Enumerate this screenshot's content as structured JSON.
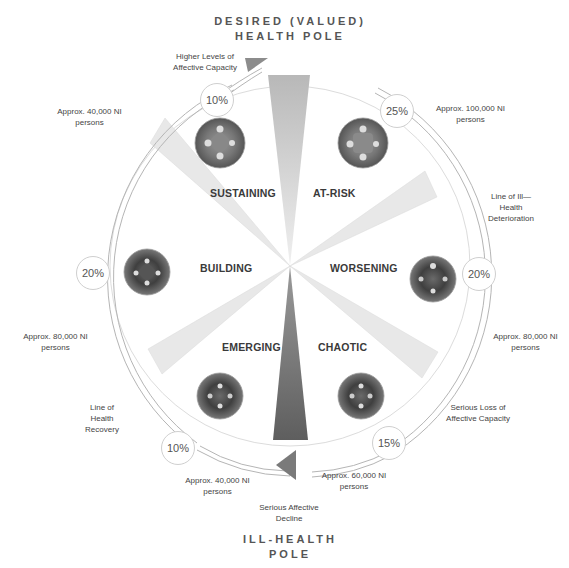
{
  "title": {
    "top_pole_line1": "DESIRED (VALUED)",
    "top_pole_line2": "HEALTH POLE",
    "bottom_pole_line1": "ILL-HEALTH",
    "bottom_pole_line2": "POLE"
  },
  "segments": [
    {
      "name": "SUSTAINING",
      "percent": "10%",
      "population": "Approx. 40,000 NI persons"
    },
    {
      "name": "AT-RISK",
      "percent": "25%",
      "population": "Approx. 100,000 NI persons"
    },
    {
      "name": "WORSENING",
      "percent": "20%",
      "population": "Approx. 80,000 NI persons"
    },
    {
      "name": "CHAOTIC",
      "percent": "15%",
      "population": "Approx. 60,000 NI persons"
    },
    {
      "name": "EMERGING",
      "percent": "10%",
      "population": "Approx. 40,000 NI persons"
    },
    {
      "name": "BUILDING",
      "percent": "20%",
      "population": "Approx. 80,000 NI persons"
    }
  ],
  "annotations": {
    "higher_levels": "Higher Levels of Affective Capacity",
    "ill_health_line": "Line of Ill—Health Deterioration",
    "serious_loss": "Serious Loss of Affective Capacity",
    "serious_decline": "Serious Affective Decline",
    "health_recovery": "Line of Health Recovery"
  },
  "colors": {
    "outer_arc": "#b0b0b0",
    "inner_circle": "#d8d8d8",
    "top_wedge": "#c4c4c4",
    "bottom_wedge": "#6e6e6e",
    "side_wedge": "#e6e6e6",
    "arrow": "#8a8a8a"
  }
}
